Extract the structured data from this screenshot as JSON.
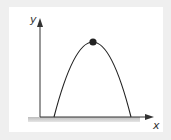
{
  "diagram": {
    "type": "projectile-parabola",
    "axes": {
      "y_label": "y",
      "x_label": "x"
    },
    "curve": {
      "shape": "parabola",
      "color": "#222222"
    },
    "peak_marker": {
      "shape": "dot",
      "color": "#222222"
    },
    "ground_shadow_color": "#c8c8c8"
  }
}
